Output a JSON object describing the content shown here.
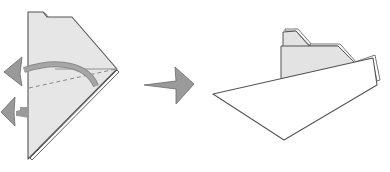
{
  "figure": {
    "title": "Origami boat folding step",
    "steps": [
      {
        "id": "step-1",
        "description": "Fold the flap back along the dashed valley line and fold the lower layer behind"
      },
      {
        "id": "step-2",
        "description": "Resulting boat shape with cabin"
      }
    ],
    "transition_arrow": "right-arrow"
  },
  "colors": {
    "background": "#ffffff",
    "paper_fill": "#e6e6e6",
    "paper_white": "#ffffff",
    "outline": "#555555",
    "arrow_fill": "#9a9a9a",
    "arrow_stroke": "#6a6a6a",
    "fold_line": "#888888"
  },
  "icons": {
    "fold_back_arrow": "curved-arrow-left",
    "fold_under_arrow": "straight-arrow-left",
    "next_step_arrow": "arrow-right"
  }
}
